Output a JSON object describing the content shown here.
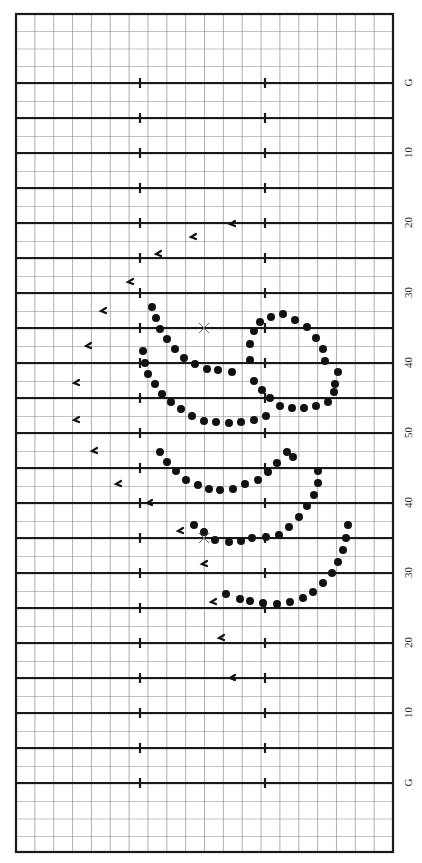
{
  "diagram": {
    "type": "marching-band-drill-chart",
    "orientation": "field rotated 90°, yard lines horizontal, sidelines vertical",
    "legend_note": "No legend is shown in the image; symbol meanings below are inferred from common drill-chart conventions, not stated on the chart."
  },
  "field": {
    "bounds": {
      "left": 16,
      "top": 14,
      "right": 393,
      "bottom": 852
    },
    "hash_x": [
      140,
      265
    ],
    "minor_grid_x_step": 18.85,
    "minor_grid_y_step": 17.5,
    "colors": {
      "line": "#1a1a1a",
      "minor_grid": "#9a9a9a",
      "grid_dot": "#c8c8c8",
      "background": "#ffffff"
    }
  },
  "yard_lines": [
    {
      "y": 83,
      "label": "G"
    },
    {
      "y": 118,
      "label": ""
    },
    {
      "y": 153,
      "label": "10"
    },
    {
      "y": 188,
      "label": ""
    },
    {
      "y": 223,
      "label": "20"
    },
    {
      "y": 258,
      "label": ""
    },
    {
      "y": 293,
      "label": "30"
    },
    {
      "y": 328,
      "label": ""
    },
    {
      "y": 363,
      "label": "40"
    },
    {
      "y": 398,
      "label": ""
    },
    {
      "y": 433,
      "label": "50"
    },
    {
      "y": 468,
      "label": ""
    },
    {
      "y": 503,
      "label": "40"
    },
    {
      "y": 538,
      "label": ""
    },
    {
      "y": 573,
      "label": "30"
    },
    {
      "y": 608,
      "label": ""
    },
    {
      "y": 643,
      "label": "20"
    },
    {
      "y": 678,
      "label": ""
    },
    {
      "y": 713,
      "label": "10"
    },
    {
      "y": 748,
      "label": ""
    },
    {
      "y": 783,
      "label": "G"
    }
  ],
  "markers": {
    "filled_dots": {
      "inferred_meaning": "performer positions (likely one section)",
      "radius": 4,
      "points": [
        [
          152,
          307
        ],
        [
          156,
          318
        ],
        [
          160,
          329
        ],
        [
          167,
          339
        ],
        [
          175,
          349
        ],
        [
          184,
          358
        ],
        [
          195,
          364
        ],
        [
          207,
          369
        ],
        [
          218,
          370
        ],
        [
          232,
          372
        ],
        [
          143,
          351
        ],
        [
          145,
          363
        ],
        [
          148,
          374
        ],
        [
          155,
          384
        ],
        [
          162,
          394
        ],
        [
          171,
          402
        ],
        [
          181,
          409
        ],
        [
          192,
          416
        ],
        [
          204,
          421
        ],
        [
          216,
          422
        ],
        [
          229,
          423
        ],
        [
          241,
          422
        ],
        [
          254,
          420
        ],
        [
          266,
          416
        ],
        [
          250,
          360
        ],
        [
          250,
          344
        ],
        [
          254,
          331
        ],
        [
          260,
          322
        ],
        [
          271,
          317
        ],
        [
          283,
          314
        ],
        [
          295,
          320
        ],
        [
          307,
          327
        ],
        [
          316,
          338
        ],
        [
          323,
          349
        ],
        [
          325,
          361
        ],
        [
          338,
          372
        ],
        [
          335,
          384
        ],
        [
          334,
          392
        ],
        [
          328,
          402
        ],
        [
          316,
          406
        ],
        [
          304,
          408
        ],
        [
          292,
          408
        ],
        [
          280,
          406
        ],
        [
          270,
          398
        ],
        [
          262,
          390
        ],
        [
          254,
          381
        ],
        [
          160,
          452
        ],
        [
          167,
          462
        ],
        [
          176,
          471
        ],
        [
          186,
          480
        ],
        [
          198,
          485
        ],
        [
          209,
          489
        ],
        [
          220,
          490
        ],
        [
          233,
          489
        ],
        [
          245,
          484
        ],
        [
          258,
          480
        ],
        [
          268,
          472
        ],
        [
          277,
          463
        ],
        [
          287,
          452
        ],
        [
          293,
          457
        ],
        [
          318,
          471
        ],
        [
          318,
          483
        ],
        [
          314,
          495
        ],
        [
          307,
          506
        ],
        [
          299,
          517
        ],
        [
          289,
          527
        ],
        [
          279,
          535
        ],
        [
          266,
          537
        ],
        [
          252,
          538
        ],
        [
          241,
          541
        ],
        [
          229,
          542
        ],
        [
          215,
          540
        ],
        [
          204,
          532
        ],
        [
          194,
          525
        ],
        [
          348,
          525
        ],
        [
          346,
          538
        ],
        [
          343,
          550
        ],
        [
          338,
          562
        ],
        [
          332,
          573
        ],
        [
          323,
          583
        ],
        [
          313,
          592
        ],
        [
          303,
          598
        ],
        [
          290,
          602
        ],
        [
          277,
          604
        ],
        [
          263,
          603
        ],
        [
          250,
          601
        ],
        [
          240,
          599
        ],
        [
          226,
          594
        ]
      ]
    },
    "performer_glyphs": {
      "inferred_meaning": "individual performer positions (small hook-shaped symbols)",
      "points": [
        [
          232,
          224
        ],
        [
          193,
          237
        ],
        [
          158,
          254
        ],
        [
          130,
          282
        ],
        [
          103,
          311
        ],
        [
          88,
          346
        ],
        [
          76,
          383
        ],
        [
          76,
          420
        ],
        [
          94,
          451
        ],
        [
          118,
          484
        ],
        [
          149,
          503
        ],
        [
          180,
          531
        ],
        [
          204,
          564
        ],
        [
          213,
          602
        ],
        [
          221,
          638
        ],
        [
          232,
          678
        ]
      ]
    },
    "x_marks": {
      "inferred_meaning": "reference points (possibly centers/pivots)",
      "points": [
        [
          204,
          328
        ],
        [
          204,
          538
        ]
      ]
    }
  },
  "label_column_x": 401
}
